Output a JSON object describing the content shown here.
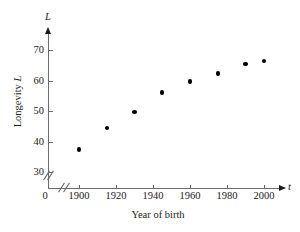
{
  "chart_data": {
    "type": "scatter",
    "title": "",
    "xlabel": "Year of birth",
    "ylabel": "Longevity L",
    "x_axis_variable": "t",
    "y_axis_variable": "L",
    "xlim": [
      1893,
      2010
    ],
    "ylim": [
      28,
      76
    ],
    "grid": false,
    "legend": null,
    "axis_break_x": true,
    "axis_break_y": true,
    "origin_label": "0",
    "x_ticks": [
      1900,
      1920,
      1940,
      1960,
      1980,
      2000
    ],
    "x_tick_labels": [
      "1900",
      "1920",
      "1940",
      "1960",
      "1980",
      "2000"
    ],
    "y_ticks": [
      30,
      40,
      50,
      60,
      70
    ],
    "y_tick_labels": [
      "30",
      "40",
      "50",
      "60",
      "70"
    ],
    "x": [
      1900,
      1915,
      1930,
      1945,
      1960,
      1975,
      1990,
      2000
    ],
    "y": [
      37.5,
      44.5,
      49.7,
      56.1,
      59.8,
      62.4,
      65.4,
      66.4
    ],
    "points": [
      {
        "year": 1900,
        "longevity": 37.5
      },
      {
        "year": 1915,
        "longevity": 44.5
      },
      {
        "year": 1930,
        "longevity": 49.7
      },
      {
        "year": 1945,
        "longevity": 56.1
      },
      {
        "year": 1960,
        "longevity": 59.8
      },
      {
        "year": 1975,
        "longevity": 62.4
      },
      {
        "year": 1990,
        "longevity": 65.4
      },
      {
        "year": 2000,
        "longevity": 66.4
      }
    ],
    "marker": "filled-circle",
    "marker_color": "#000000",
    "axis_color": "#6b6b6b"
  }
}
